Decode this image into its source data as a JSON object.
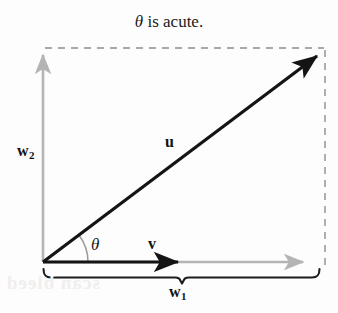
{
  "figure": {
    "title": "θ is acute.",
    "title_parts": {
      "symbol": "θ",
      "rest": " is acute."
    },
    "background_color": "#fdfdfd",
    "width": 338,
    "height": 313
  },
  "labels": {
    "w2": {
      "base": "w",
      "subscript": "2",
      "text": "w₂"
    },
    "w1": {
      "base": "w",
      "subscript": "1",
      "text": "w₁"
    },
    "u": "u",
    "v": "v",
    "theta": "θ"
  },
  "colors": {
    "vector_black": "#141414",
    "axis_gray": "#b0b0b0",
    "dashed_gray": "#8d8d8d",
    "arc_gray": "#9a9a9a",
    "text": "#1a1a1a",
    "bleed": "#f0eeee"
  },
  "geometry": {
    "origin": {
      "x": 43,
      "y": 262
    },
    "u_tip": {
      "x": 325,
      "y": 50
    },
    "v_tip": {
      "x": 185,
      "y": 262
    },
    "w1_axis_tip": {
      "x": 311,
      "y": 262
    },
    "w2_axis_tip": {
      "x": 43,
      "y": 48
    },
    "dashed_top_y": 48,
    "dashed_right_x": 325,
    "brace_left_x": 43,
    "brace_right_x": 320,
    "brace_center_x": 182,
    "brace_y": 270,
    "angle_arc_radius": 45,
    "angle_degrees": 37
  },
  "artifact": {
    "bleed_text": "scan bleed"
  }
}
